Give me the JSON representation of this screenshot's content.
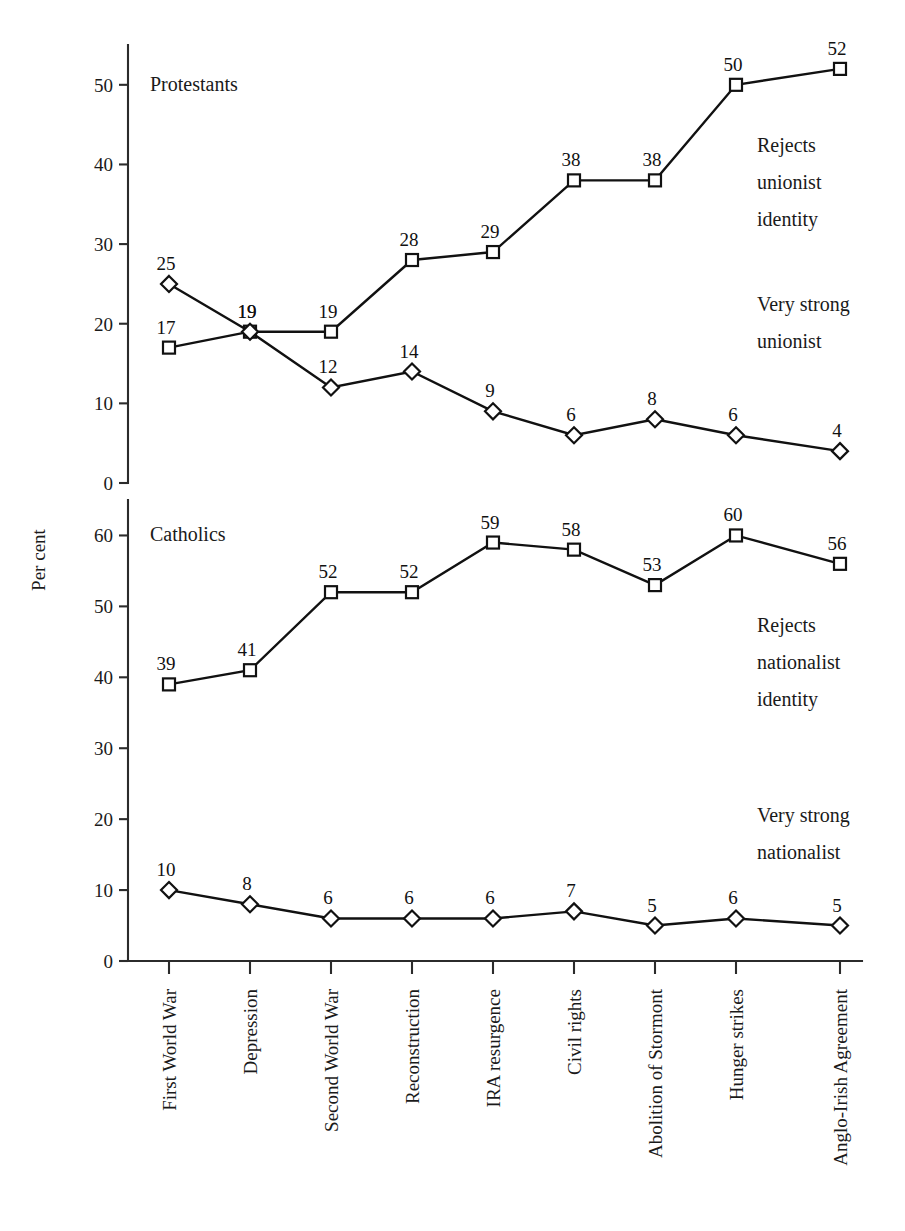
{
  "figure": {
    "y_axis_title": "Per cent",
    "panels": [
      {
        "name": "protestants",
        "title": "Protestants",
        "ylim": [
          0,
          55
        ],
        "yticks": [
          0,
          10,
          20,
          30,
          40,
          50
        ],
        "legend": [
          {
            "name": "rejects-unionist-identity",
            "lines": [
              "Rejects",
              "unionist",
              "identity"
            ]
          },
          {
            "name": "very-strong-unionist",
            "lines": [
              "Very strong",
              "unionist"
            ]
          }
        ]
      },
      {
        "name": "catholics",
        "title": "Catholics",
        "ylim": [
          0,
          65
        ],
        "yticks": [
          0,
          10,
          20,
          30,
          40,
          50,
          60
        ],
        "legend": [
          {
            "name": "rejects-nationalist-identity",
            "lines": [
              "Rejects",
              "nationalist",
              "identity"
            ]
          },
          {
            "name": "very-strong-nationalist",
            "lines": [
              "Very strong",
              "nationalist"
            ]
          }
        ]
      }
    ]
  },
  "chart_data": [
    {
      "type": "line",
      "title": "Protestants",
      "xlabel": "",
      "ylabel": "Per cent",
      "ylim": [
        0,
        55
      ],
      "yticks": [
        0,
        10,
        20,
        30,
        40,
        50
      ],
      "grid": false,
      "legend_position": "right-inside",
      "categories": [
        "First World War",
        "Depression",
        "Second World War",
        "Reconstruction",
        "IRA resurgence",
        "Civil rights",
        "Abolition of Stormont",
        "Hunger strikes",
        "Anglo-Irish Agreement"
      ],
      "series": [
        {
          "name": "Rejects unionist identity",
          "marker": "square",
          "values": [
            17,
            19,
            19,
            28,
            29,
            38,
            38,
            50,
            52
          ]
        },
        {
          "name": "Very strong unionist",
          "marker": "diamond",
          "values": [
            25,
            19,
            12,
            14,
            9,
            6,
            8,
            6,
            4
          ]
        }
      ]
    },
    {
      "type": "line",
      "title": "Catholics",
      "xlabel": "",
      "ylabel": "Per cent",
      "ylim": [
        0,
        65
      ],
      "yticks": [
        0,
        10,
        20,
        30,
        40,
        50,
        60
      ],
      "grid": false,
      "legend_position": "right-inside",
      "categories": [
        "First World War",
        "Depression",
        "Second World War",
        "Reconstruction",
        "IRA resurgence",
        "Civil rights",
        "Abolition of Stormont",
        "Hunger strikes",
        "Anglo-Irish Agreement"
      ],
      "series": [
        {
          "name": "Rejects nationalist identity",
          "marker": "square",
          "values": [
            39,
            41,
            52,
            52,
            59,
            58,
            53,
            60,
            56
          ]
        },
        {
          "name": "Very strong nationalist",
          "marker": "diamond",
          "values": [
            10,
            8,
            6,
            6,
            6,
            7,
            5,
            6,
            5
          ]
        }
      ]
    }
  ]
}
